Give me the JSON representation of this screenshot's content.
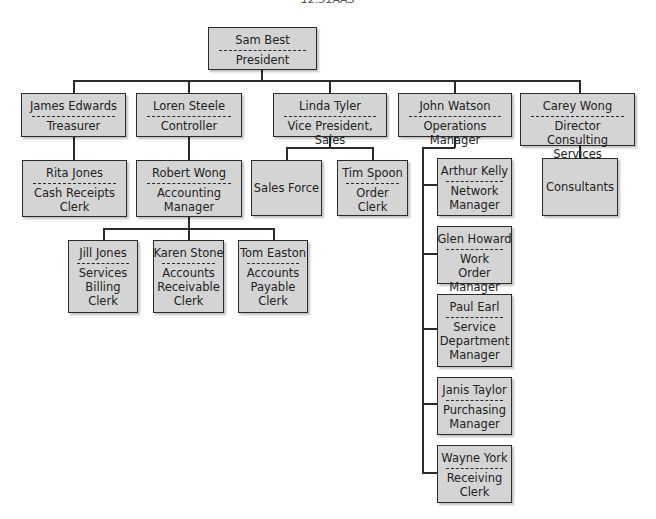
{
  "caption": "12.31AAS",
  "org_chart": {
    "president": {
      "name": "Sam Best",
      "title": "President"
    },
    "treasurer": {
      "name": "James Edwards",
      "title": "Treasurer"
    },
    "controller": {
      "name": "Loren Steele",
      "title": "Controller"
    },
    "vp_sales": {
      "name": "Linda Tyler",
      "title": "Vice President, Sales"
    },
    "operations": {
      "name": "John Watson",
      "title": "Operations Manager"
    },
    "consulting": {
      "name": "Carey Wong",
      "title": "Director Consulting\nServices"
    },
    "cash_receipts": {
      "name": "Rita Jones",
      "title": "Cash Receipts\nClerk"
    },
    "accounting_mgr": {
      "name": "Robert Wong",
      "title": "Accounting\nManager"
    },
    "sales_force": {
      "label": "Sales Force"
    },
    "order_clerk": {
      "name": "Tim Spoon",
      "title": "Order Clerk"
    },
    "consultants": {
      "label": "Consultants"
    },
    "billing_clerk": {
      "name": "Jill Jones",
      "title": "Services\nBilling\nClerk"
    },
    "ar_clerk": {
      "name": "Karen Stone",
      "title": "Accounts\nReceivable\nClerk"
    },
    "ap_clerk": {
      "name": "Tom Easton",
      "title": "Accounts\nPayable\nClerk"
    },
    "network_mgr": {
      "name": "Arthur Kelly",
      "title": "Network\nManager"
    },
    "work_order_mgr": {
      "name": "Glen Howard",
      "title": "Work Order\nManager"
    },
    "service_dept_mgr": {
      "name": "Paul Earl",
      "title": "Service\nDepartment\nManager"
    },
    "purchasing_mgr": {
      "name": "Janis Taylor",
      "title": "Purchasing\nManager"
    },
    "receiving_clerk": {
      "name": "Wayne York",
      "title": "Receiving\nClerk"
    }
  },
  "colors": {
    "box_fill": "#d4d4d4",
    "line": "#2b2b2b",
    "background": "#ffffff"
  }
}
